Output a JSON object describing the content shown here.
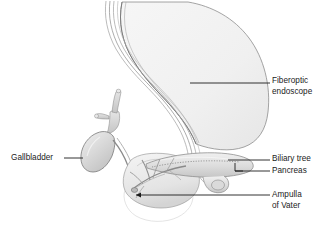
{
  "figure": {
    "background_color": "#ffffff",
    "labels": {
      "fiberoptic_endoscope": "Fiberoptic\nendoscope",
      "gallbladder": "Gallbladder",
      "biliary_tree": "Biliary tree",
      "pancreas": "Pancreas",
      "ampulla_of_vater": "Ampulla\nof Vater"
    },
    "colors": {
      "outline": "#6e6e6e",
      "outline_light": "#9a9a9a",
      "organ_fill": "#f2f2f2",
      "organ_fill_mid": "#e2e2e2",
      "organ_fill_dark": "#c9c9c9",
      "leader_line": "#1b1b1b",
      "text": "#1b1b1b"
    },
    "parts": [
      "stomach",
      "endoscope-tube",
      "gallbladder",
      "hepatic-ducts",
      "common-bile-duct",
      "pancreas",
      "pancreatic-duct",
      "duodenum",
      "ampulla-of-vater"
    ]
  }
}
